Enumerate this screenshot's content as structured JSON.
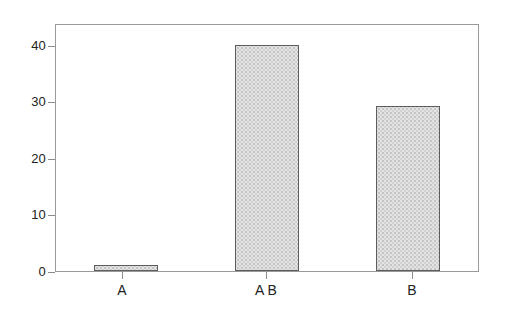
{
  "chart_data": {
    "type": "bar",
    "title": "",
    "subtitle": "",
    "xlabel": "",
    "ylabel": "",
    "categories": [
      "A",
      "A B",
      "B"
    ],
    "values": [
      1.0,
      40.2,
      29.4
    ],
    "series": [
      {
        "name": "",
        "values": [
          1.0,
          40.2,
          29.4
        ]
      }
    ],
    "ylim": [
      0,
      43.8
    ],
    "xlim": [
      0,
      3
    ],
    "yticks": [
      0,
      10,
      20,
      30,
      40
    ],
    "ytick_labels": [
      "0",
      "10",
      "20",
      "30",
      "40"
    ],
    "xtick_labels": [
      "A",
      "A B",
      "B"
    ],
    "grid": false,
    "legend": null,
    "legend_position": "none",
    "annotations": [],
    "bar_fill": "#e4e4e4",
    "bar_fill_pattern": "stipple-dots",
    "bar_edge_color": "#5d5d5d",
    "axis_color": "#9a9a9a",
    "background": "#ffffff",
    "text_color": "#222222"
  },
  "axes": {
    "y_ticks": [
      {
        "label": "40",
        "value": 40
      },
      {
        "label": "30",
        "value": 30
      },
      {
        "label": "20",
        "value": 20
      },
      {
        "label": "10",
        "value": 10
      },
      {
        "label": "0",
        "value": 0
      }
    ],
    "x_ticks": [
      {
        "label": "A"
      },
      {
        "label": "A B"
      },
      {
        "label": "B"
      }
    ]
  }
}
